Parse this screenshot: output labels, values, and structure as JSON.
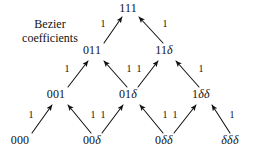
{
  "figure": {
    "background_color": "#ffffff",
    "ink_color": "#111111",
    "caption": {
      "line1": "Bezier",
      "line2": "coefficients"
    }
  },
  "chart_data": {
    "type": "diagram",
    "rows": [
      {
        "level": 0,
        "nodes": [
          {
            "id": "111",
            "label": "111",
            "x": 128,
            "y": 8
          }
        ]
      },
      {
        "level": 1,
        "nodes": [
          {
            "id": "011",
            "label": "011",
            "x": 92,
            "y": 50
          },
          {
            "id": "11d",
            "label": "11δ",
            "x": 164,
            "y": 50
          }
        ]
      },
      {
        "level": 2,
        "nodes": [
          {
            "id": "001",
            "label": "001",
            "x": 56,
            "y": 94
          },
          {
            "id": "01d",
            "label": "01δ",
            "x": 128,
            "y": 94
          },
          {
            "id": "1dd",
            "label": "1δδ",
            "x": 201,
            "y": 94
          }
        ]
      },
      {
        "level": 3,
        "nodes": [
          {
            "id": "000",
            "label": "000",
            "x": 20,
            "y": 140
          },
          {
            "id": "00d",
            "label": "00δ",
            "x": 92,
            "y": 140
          },
          {
            "id": "0dd",
            "label": "0δδ",
            "x": 164,
            "y": 140
          },
          {
            "id": "ddd",
            "label": "δδδ",
            "x": 230,
            "y": 140
          }
        ]
      }
    ],
    "edges": [
      {
        "from": "011",
        "to": "111",
        "label": "1",
        "label_x": 103,
        "label_y": 24
      },
      {
        "from": "11d",
        "to": "111",
        "label": "1",
        "label_x": 165,
        "label_y": 24
      },
      {
        "from": "001",
        "to": "011",
        "label": "1",
        "label_x": 67,
        "label_y": 69
      },
      {
        "from": "01d",
        "to": "011",
        "label": "1",
        "label_x": 129,
        "label_y": 69
      },
      {
        "from": "01d",
        "to": "11d",
        "label": "1",
        "label_x": 139,
        "label_y": 69
      },
      {
        "from": "1dd",
        "to": "11d",
        "label": "1",
        "label_x": 201,
        "label_y": 69
      },
      {
        "from": "000",
        "to": "001",
        "label": "1",
        "label_x": 31,
        "label_y": 115
      },
      {
        "from": "00d",
        "to": "001",
        "label": "1",
        "label_x": 93,
        "label_y": 115
      },
      {
        "from": "00d",
        "to": "01d",
        "label": "1",
        "label_x": 103,
        "label_y": 115
      },
      {
        "from": "0dd",
        "to": "01d",
        "label": "1",
        "label_x": 165,
        "label_y": 115
      },
      {
        "from": "0dd",
        "to": "1dd",
        "label": "1",
        "label_x": 175,
        "label_y": 115
      },
      {
        "from": "ddd",
        "to": "1dd",
        "label": "1",
        "label_x": 232,
        "label_y": 115
      }
    ],
    "edge_geometry": [
      {
        "from": "011",
        "to": "111",
        "x1": 104,
        "y1": 43,
        "x2": 122,
        "y2": 17
      },
      {
        "from": "11d",
        "to": "111",
        "x1": 163,
        "y1": 43,
        "x2": 139,
        "y2": 17
      },
      {
        "from": "001",
        "to": "011",
        "x1": 68,
        "y1": 87,
        "x2": 88,
        "y2": 61
      },
      {
        "from": "01d",
        "to": "011",
        "x1": 127,
        "y1": 87,
        "x2": 104,
        "y2": 61
      },
      {
        "from": "01d",
        "to": "11d",
        "x1": 138,
        "y1": 87,
        "x2": 158,
        "y2": 61
      },
      {
        "from": "1dd",
        "to": "11d",
        "x1": 199,
        "y1": 87,
        "x2": 176,
        "y2": 61
      },
      {
        "from": "000",
        "to": "001",
        "x1": 32,
        "y1": 133,
        "x2": 52,
        "y2": 105
      },
      {
        "from": "00d",
        "to": "001",
        "x1": 91,
        "y1": 133,
        "x2": 68,
        "y2": 105
      },
      {
        "from": "00d",
        "to": "01d",
        "x1": 102,
        "y1": 133,
        "x2": 123,
        "y2": 105
      },
      {
        "from": "0dd",
        "to": "01d",
        "x1": 163,
        "y1": 133,
        "x2": 140,
        "y2": 105
      },
      {
        "from": "0dd",
        "to": "1dd",
        "x1": 174,
        "y1": 133,
        "x2": 196,
        "y2": 105
      },
      {
        "from": "ddd",
        "to": "1dd",
        "x1": 230,
        "y1": 133,
        "x2": 212,
        "y2": 105
      }
    ]
  }
}
